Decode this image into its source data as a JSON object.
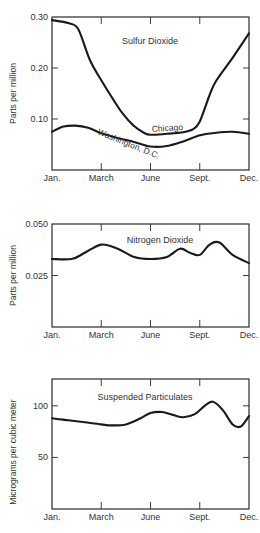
{
  "chart_data": [
    {
      "type": "line",
      "title": "Sulfur Dioxide",
      "xlabel": "",
      "ylabel": "Parts per million",
      "x_tick_labels": [
        "Jan.",
        "March",
        "June",
        "Sept.",
        "Dec."
      ],
      "x_tick_positions": [
        0,
        3,
        6,
        9,
        12
      ],
      "xlim": [
        0,
        12
      ],
      "ylim": [
        0,
        0.3
      ],
      "y_ticks": [
        0.1,
        0.2,
        0.3
      ],
      "y_tick_labels": [
        "0.10",
        "0.20",
        "0.30"
      ],
      "grid": false,
      "series": [
        {
          "name": "Chicago",
          "x": [
            0,
            1,
            1.6,
            2.3,
            3.0,
            3.7,
            4.3,
            5.0,
            5.6,
            6.0,
            7.0,
            8.0,
            8.6,
            9.0,
            9.6,
            10.0,
            11.0,
            12.0
          ],
          "y": [
            0.294,
            0.288,
            0.276,
            0.216,
            0.176,
            0.14,
            0.111,
            0.086,
            0.073,
            0.069,
            0.071,
            0.074,
            0.08,
            0.095,
            0.147,
            0.175,
            0.22,
            0.268
          ]
        },
        {
          "name": "Washington, D.C.",
          "x": [
            0,
            0.7,
            1.4,
            2.2,
            3.0,
            4.0,
            5.0,
            6.0,
            7.0,
            8.0,
            9.0,
            10.0,
            11.0,
            12.0
          ],
          "y": [
            0.075,
            0.085,
            0.087,
            0.083,
            0.072,
            0.063,
            0.055,
            0.046,
            0.047,
            0.056,
            0.068,
            0.073,
            0.075,
            0.071
          ]
        }
      ],
      "annotations": [
        {
          "text": "Sulfur Dioxide"
        },
        {
          "text": "Chicago"
        },
        {
          "text": "Washington, D.C."
        }
      ]
    },
    {
      "type": "line",
      "title": "Nitrogen Dioxide",
      "xlabel": "",
      "ylabel": "Parts per million",
      "x_tick_labels": [
        "Jan.",
        "March",
        "June",
        "Sept.",
        "Dec."
      ],
      "x_tick_positions": [
        0,
        3,
        6,
        9,
        12
      ],
      "xlim": [
        0,
        12
      ],
      "ylim": [
        0,
        0.05
      ],
      "y_ticks": [
        0.025,
        0.05
      ],
      "y_tick_labels": [
        "0.025",
        "0.050"
      ],
      "grid": false,
      "series": [
        {
          "name": "Nitrogen Dioxide",
          "x": [
            0,
            1.2,
            2.0,
            3.0,
            4.0,
            5.0,
            6.0,
            7.0,
            7.8,
            8.4,
            9.0,
            9.6,
            10.2,
            11.0,
            12.0
          ],
          "y": [
            0.033,
            0.033,
            0.036,
            0.04,
            0.038,
            0.034,
            0.033,
            0.034,
            0.038,
            0.036,
            0.035,
            0.04,
            0.041,
            0.035,
            0.031
          ]
        }
      ],
      "annotations": [
        {
          "text": "Nitrogen Dioxide"
        }
      ]
    },
    {
      "type": "line",
      "title": "Suspended Particulates",
      "xlabel": "",
      "ylabel": "Micrograms per cubic meter",
      "x_tick_labels": [
        "Jan.",
        "March",
        "June",
        "Sept.",
        "Dec."
      ],
      "x_tick_positions": [
        0,
        3,
        6,
        9,
        12
      ],
      "xlim": [
        0,
        12
      ],
      "ylim": [
        0,
        126
      ],
      "y_ticks": [
        50,
        100
      ],
      "y_tick_labels": [
        "50",
        "100"
      ],
      "grid": false,
      "series": [
        {
          "name": "Suspended Particulates",
          "x": [
            0,
            1.0,
            2.0,
            3.0,
            3.6,
            4.5,
            5.4,
            6.0,
            6.7,
            7.4,
            8.0,
            8.7,
            9.3,
            9.8,
            10.4,
            11.0,
            11.5,
            12.0
          ],
          "y": [
            88,
            86,
            84,
            82,
            81,
            82,
            88,
            93,
            94,
            91,
            89,
            92,
            100,
            104,
            96,
            82,
            80,
            90
          ]
        }
      ],
      "annotations": [
        {
          "text": "Suspended Particulates"
        }
      ]
    }
  ]
}
